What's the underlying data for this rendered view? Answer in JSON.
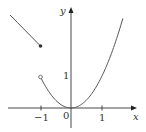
{
  "chart_data": {
    "type": "line",
    "title": "",
    "xlabel": "x",
    "ylabel": "y",
    "xlim": [
      -2.0,
      1.8
    ],
    "ylim": [
      -0.4,
      3.2
    ],
    "grid": false,
    "x_ticks": [
      -1,
      0,
      1
    ],
    "x_tick_labels": [
      "−1",
      "0",
      "1"
    ],
    "y_ticks": [
      1
    ],
    "y_tick_labels": [
      "1"
    ],
    "origin_label": "0",
    "series": [
      {
        "name": "f(x) = 1 − x, x ≤ −1",
        "x": [
          -2.0,
          -1.75,
          -1.5,
          -1.25,
          -1.0
        ],
        "y": [
          3.0,
          2.75,
          2.5,
          2.25,
          2.0
        ],
        "endpoint": {
          "x": -1,
          "y": 2,
          "style": "closed"
        }
      },
      {
        "name": "f(x) = x², x > −1",
        "x": [
          -1.0,
          -0.75,
          -0.5,
          -0.25,
          0.0,
          0.25,
          0.5,
          0.75,
          1.0,
          1.25,
          1.5,
          1.7
        ],
        "y": [
          1.0,
          0.5625,
          0.25,
          0.0625,
          0.0,
          0.0625,
          0.25,
          0.5625,
          1.0,
          1.5625,
          2.25,
          2.89
        ],
        "endpoint": {
          "x": -1,
          "y": 1,
          "style": "open"
        }
      }
    ],
    "colors": {
      "curve": "#555555",
      "axis": "#333333"
    }
  }
}
